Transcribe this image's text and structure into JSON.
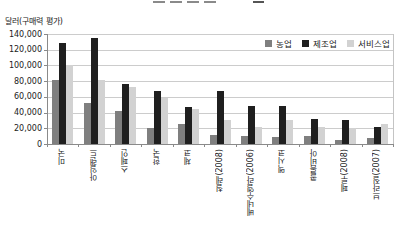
{
  "y_axis_title": "달러(구매력 평가)",
  "chart_data": {
    "type": "bar",
    "title": "",
    "ylabel": "달러(구매력 평가)",
    "categories": [
      "미국",
      "아일랜드",
      "스페인",
      "한국",
      "체코",
      "칠레(2008)",
      "베네수엘라(2006)",
      "멕시코",
      "콜롬비아",
      "페루(2008)",
      "브라질(2007)"
    ],
    "series": [
      {
        "name": "농업",
        "color": "#7f7f7f",
        "values": [
          81000,
          52000,
          42000,
          21000,
          26000,
          11000,
          10000,
          9000,
          10000,
          5000,
          8000
        ]
      },
      {
        "name": "제조업",
        "color": "#1f1f1f",
        "values": [
          129000,
          135000,
          77000,
          67000,
          47000,
          67000,
          49000,
          49000,
          32000,
          30000,
          22000
        ]
      },
      {
        "name": "서비스업",
        "color": "#d2d2d2",
        "values": [
          100000,
          82000,
          72000,
          58000,
          44000,
          30000,
          22000,
          31000,
          22000,
          20000,
          26000
        ]
      }
    ],
    "ylim": [
      0,
      140000
    ],
    "y_ticks": [
      "140,000",
      "120,000",
      "100,000",
      "80,000",
      "60,000",
      "40,000",
      "20,000",
      "0"
    ],
    "grid": true,
    "legend_position": "top-right-inside"
  }
}
